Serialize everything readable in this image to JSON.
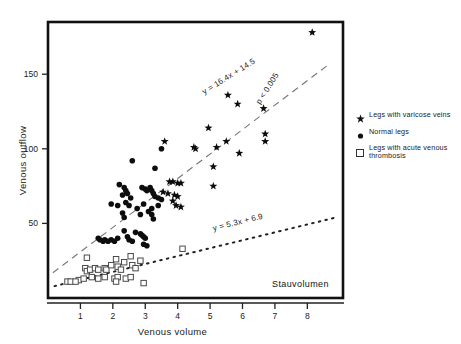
{
  "chart_data": {
    "type": "scatter",
    "title": "",
    "xlabel": "Venous volume",
    "ylabel": "Venous outflow",
    "xlim": [
      0,
      9.1
    ],
    "ylim": [
      0,
      185
    ],
    "xticks": [
      1,
      2,
      3,
      4,
      5,
      6,
      7,
      8
    ],
    "yticks": [
      50,
      100,
      150
    ],
    "grid": false,
    "corner_annotation": "Stauvolumen",
    "legend": {
      "position": "right",
      "entries": [
        {
          "marker": "star",
          "label": "Legs with varicose veins"
        },
        {
          "marker": "circle",
          "label": "Normal legs"
        },
        {
          "marker": "square",
          "label": "Legs with acute venous thrombosis"
        }
      ]
    },
    "annotations": [
      {
        "id": "upper-fit-equation",
        "text": "y = 16.4x + 14.5"
      },
      {
        "id": "upper-fit-significance",
        "text": "p < 0.005"
      },
      {
        "id": "lower-fit-equation",
        "text": "y = 5.3x + 6.9"
      }
    ],
    "fits": [
      {
        "name": "upper-regression-dashed",
        "equation": "y = 16.4x + 14.5",
        "slope": 16.4,
        "intercept": 14.5,
        "style": "dashed",
        "x_range": [
          0.15,
          8.6
        ]
      },
      {
        "name": "lower-regression-dotted",
        "equation": "y = 5.3x + 6.9",
        "slope": 5.3,
        "intercept": 6.9,
        "style": "dotted",
        "x_range": [
          0.2,
          8.9
        ]
      }
    ],
    "series": [
      {
        "name": "Legs with varicose veins",
        "marker": "star",
        "points": [
          [
            8.15,
            178
          ],
          [
            5.55,
            136
          ],
          [
            5.85,
            130
          ],
          [
            6.65,
            127
          ],
          [
            4.95,
            114
          ],
          [
            3.6,
            105
          ],
          [
            5.5,
            105
          ],
          [
            6.7,
            110
          ],
          [
            6.7,
            105
          ],
          [
            5.9,
            97
          ],
          [
            4.5,
            101
          ],
          [
            4.55,
            100
          ],
          [
            5.2,
            101
          ],
          [
            5.1,
            88
          ],
          [
            5.1,
            75
          ],
          [
            3.75,
            78
          ],
          [
            3.85,
            78
          ],
          [
            4.0,
            77
          ],
          [
            4.1,
            77
          ],
          [
            3.55,
            71
          ],
          [
            3.7,
            70
          ],
          [
            3.9,
            69
          ],
          [
            4.0,
            68
          ],
          [
            3.85,
            65
          ],
          [
            3.95,
            62
          ],
          [
            4.1,
            61
          ]
        ]
      },
      {
        "name": "Normal legs",
        "marker": "circle",
        "points": [
          [
            2.6,
            92
          ],
          [
            3.3,
            87
          ],
          [
            3.5,
            100
          ],
          [
            2.2,
            76
          ],
          [
            2.35,
            74
          ],
          [
            2.4,
            72
          ],
          [
            2.3,
            69
          ],
          [
            2.45,
            70
          ],
          [
            2.55,
            67
          ],
          [
            2.4,
            64
          ],
          [
            1.95,
            63
          ],
          [
            2.15,
            62
          ],
          [
            2.9,
            74
          ],
          [
            3.0,
            73
          ],
          [
            3.05,
            72
          ],
          [
            3.15,
            74
          ],
          [
            3.2,
            72
          ],
          [
            3.25,
            70
          ],
          [
            3.3,
            68
          ],
          [
            3.4,
            67
          ],
          [
            3.5,
            66
          ],
          [
            3.4,
            62
          ],
          [
            3.2,
            60
          ],
          [
            3.1,
            58
          ],
          [
            2.95,
            63
          ],
          [
            3.2,
            56
          ],
          [
            3.25,
            53
          ],
          [
            2.3,
            57
          ],
          [
            2.35,
            54
          ],
          [
            2.5,
            62
          ],
          [
            2.75,
            60
          ],
          [
            2.85,
            56
          ],
          [
            1.55,
            40
          ],
          [
            1.6,
            39
          ],
          [
            1.7,
            38
          ],
          [
            1.75,
            39
          ],
          [
            1.85,
            38
          ],
          [
            1.95,
            39
          ],
          [
            2.05,
            38
          ],
          [
            2.15,
            40
          ],
          [
            2.35,
            45
          ],
          [
            2.45,
            41
          ],
          [
            2.5,
            39
          ],
          [
            2.6,
            38
          ],
          [
            2.7,
            44
          ],
          [
            2.85,
            43
          ],
          [
            2.9,
            42
          ],
          [
            2.95,
            41
          ],
          [
            3.0,
            40
          ],
          [
            2.95,
            36
          ],
          [
            3.05,
            35
          ]
        ]
      },
      {
        "name": "Legs with acute venous thrombosis",
        "marker": "square",
        "points": [
          [
            1.2,
            27
          ],
          [
            1.15,
            20
          ],
          [
            1.2,
            18
          ],
          [
            1.3,
            19
          ],
          [
            1.45,
            20
          ],
          [
            1.55,
            19
          ],
          [
            1.75,
            20
          ],
          [
            1.8,
            19
          ],
          [
            1.95,
            22
          ],
          [
            2.1,
            26
          ],
          [
            2.15,
            21
          ],
          [
            2.25,
            19
          ],
          [
            2.35,
            24
          ],
          [
            2.55,
            28
          ],
          [
            2.6,
            22
          ],
          [
            2.7,
            20
          ],
          [
            2.85,
            25
          ],
          [
            4.15,
            33
          ],
          [
            1.35,
            14
          ],
          [
            1.55,
            13
          ],
          [
            1.75,
            14
          ],
          [
            2.05,
            13
          ],
          [
            2.15,
            14
          ],
          [
            2.4,
            13
          ],
          [
            2.55,
            14
          ],
          [
            0.95,
            12
          ],
          [
            1.1,
            13
          ],
          [
            0.6,
            11
          ],
          [
            0.7,
            11
          ],
          [
            0.85,
            11
          ],
          [
            2.1,
            11
          ],
          [
            2.95,
            10
          ]
        ]
      }
    ]
  },
  "axes": {
    "x_tick_labels": [
      "1",
      "2",
      "3",
      "4",
      "5",
      "6",
      "7",
      "8"
    ],
    "y_tick_labels": [
      "50",
      "100",
      "150"
    ]
  }
}
